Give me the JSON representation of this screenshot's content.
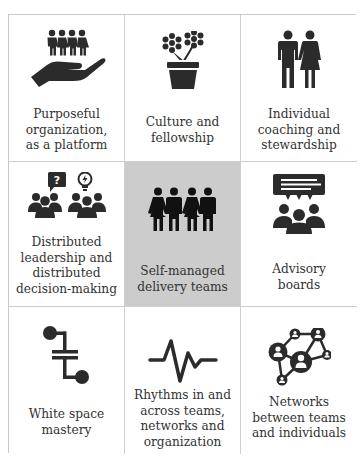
{
  "figure": {
    "grid": {
      "rows": 3,
      "columns": 3
    },
    "colors": {
      "icon": "#2b2b2b",
      "text": "#333333",
      "highlight_bg": "#cccccc",
      "border": "#cfcfcf"
    },
    "cells": [
      {
        "label": "Purposeful\norganization,\nas a platform",
        "icon": "hand-holding-people-icon"
      },
      {
        "label": "Culture and\nfellowship",
        "icon": "flower-pot-icon"
      },
      {
        "label": "Individual\ncoaching and\nstewardship",
        "icon": "man-woman-icon"
      },
      {
        "label": "Distributed\nleadership and\ndistributed\ndecision-making",
        "icon": "groups-question-idea-icon"
      },
      {
        "label": "Self-managed\ndelivery teams",
        "icon": "team-holding-hands-icon",
        "highlighted": true
      },
      {
        "label": "Advisory\nboards",
        "icon": "group-speech-bubble-icon"
      },
      {
        "label": "White space\nmastery",
        "icon": "connector-icon"
      },
      {
        "label": "Rhythms in and\nacross teams,\nnetworks and\norganization",
        "icon": "heartbeat-wave-icon"
      },
      {
        "label": "Networks\nbetween teams\nand individuals",
        "icon": "people-network-icon"
      }
    ]
  }
}
